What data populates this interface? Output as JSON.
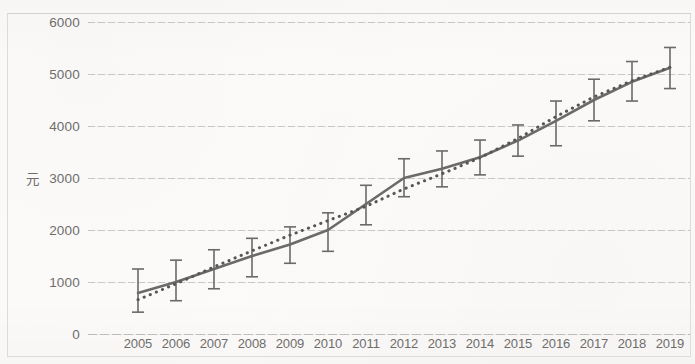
{
  "chart_data": {
    "type": "line",
    "title": "",
    "subtitle": "",
    "xlabel": "",
    "ylabel": "元",
    "categories": [
      "2005",
      "2006",
      "2007",
      "2008",
      "2009",
      "2010",
      "2011",
      "2012",
      "2013",
      "2014",
      "2015",
      "2016",
      "2017",
      "2018",
      "2019"
    ],
    "ylim": [
      0,
      6000
    ],
    "ytick_values": [
      6000,
      5000,
      4000,
      3000,
      2000,
      1000,
      0
    ],
    "ytick_labels": [
      "6000",
      "5000",
      "4000",
      "3000",
      "2000",
      "1000",
      "0"
    ],
    "grid": true,
    "legend": "none",
    "series": [
      {
        "name": "观测值",
        "style": "solid",
        "color": "#6b6a68",
        "values": [
          790,
          1000,
          1250,
          1500,
          1720,
          2000,
          2500,
          3000,
          3180,
          3400,
          3720,
          4100,
          4500,
          4850,
          5120
        ],
        "error_bars": {
          "lower": [
            420,
            640,
            870,
            1100,
            1360,
            1590,
            2100,
            2640,
            2830,
            3060,
            3420,
            3620,
            4100,
            4480,
            4720
          ],
          "upper": [
            1250,
            1420,
            1620,
            1840,
            2060,
            2330,
            2860,
            3370,
            3520,
            3730,
            4020,
            4480,
            4900,
            5240,
            5510
          ]
        }
      },
      {
        "name": "趋势线",
        "style": "dotted",
        "color": "#575654",
        "values": [
          660,
          965,
          1290,
          1600,
          1900,
          2180,
          2455,
          2790,
          3080,
          3390,
          3760,
          4180,
          4560,
          4870,
          5130
        ]
      }
    ]
  }
}
